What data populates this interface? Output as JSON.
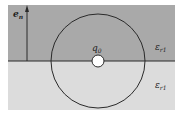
{
  "diagram": {
    "type": "dielectric-interface-point-charge",
    "colors": {
      "upper_region": "#a9a9a9",
      "lower_region": "#dcdcdc",
      "lines": "#2a2a2a",
      "charge_fill": "#ffffff",
      "background": "#ffffff"
    },
    "labels": {
      "normal_vector": "e",
      "normal_vector_sub": "n",
      "charge": "q",
      "charge_sub": "0",
      "upper_medium": "ε",
      "upper_medium_sub": "r1",
      "lower_medium": "ε",
      "lower_medium_sub": "r1"
    }
  }
}
